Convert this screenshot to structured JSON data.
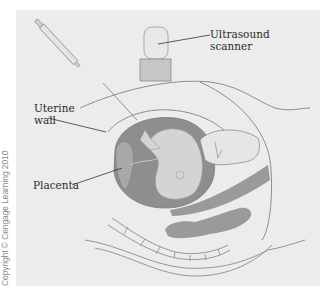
{
  "figure": {
    "labels": {
      "scanner_line1": "Ultrasound",
      "scanner_line2": "scanner",
      "uterine_line1": "Uterine",
      "uterine_line2": "wall",
      "placenta": "Placenta"
    },
    "copyright": "Copyright © Cengage Learning 2010"
  },
  "colors": {
    "panel_bg": "#ececec",
    "outline": "#8c8c8c",
    "amniotic": "#8e8e8e",
    "fetus": "#d4d4d4",
    "organ": "#9a9a9a"
  }
}
